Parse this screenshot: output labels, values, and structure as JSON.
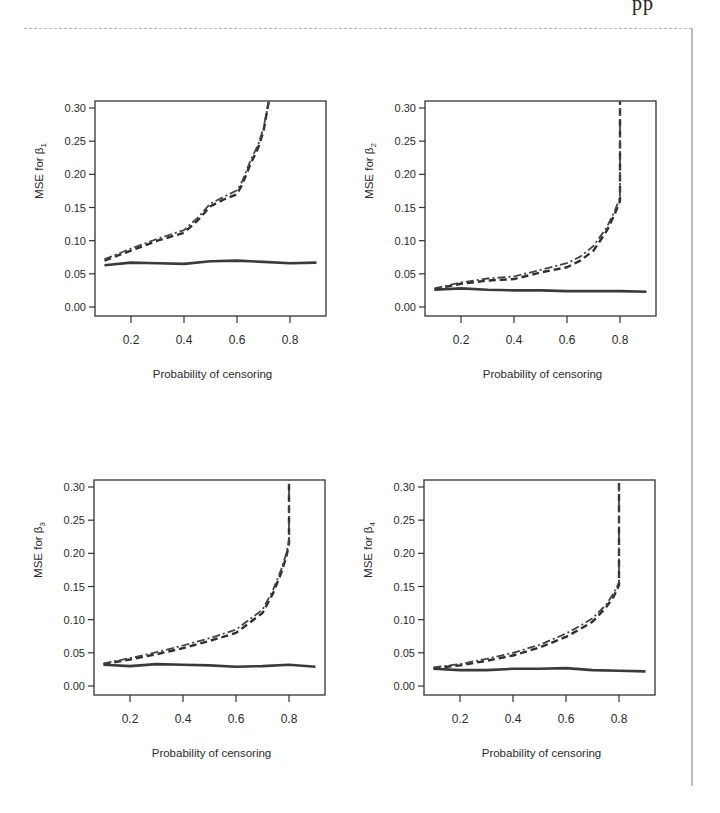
{
  "header": {
    "fragment": "pp"
  },
  "chart_data": [
    {
      "type": "line",
      "title": "",
      "xlabel": "Probability of censoring",
      "ylabel": "MSE for β1",
      "ylabel_main": "MSE for β",
      "ylabel_sub": "1",
      "xlim": [
        0.05,
        0.95
      ],
      "ylim": [
        0.0,
        0.31
      ],
      "xticks": [
        0.2,
        0.4,
        0.6,
        0.8
      ],
      "xtick_labels": [
        "0.2",
        "0.4",
        "0.6",
        "0.8"
      ],
      "yticks": [
        0.0,
        0.05,
        0.1,
        0.15,
        0.2,
        0.25,
        0.3
      ],
      "ytick_labels": [
        "0.00",
        "0.05",
        "0.10",
        "0.15",
        "0.20",
        "0.25",
        "0.30"
      ],
      "grid": false,
      "legend": null,
      "series": [
        {
          "name": "solid",
          "style": "solid",
          "x": [
            0.1,
            0.2,
            0.3,
            0.4,
            0.5,
            0.6,
            0.7,
            0.8,
            0.9
          ],
          "y": [
            0.063,
            0.067,
            0.066,
            0.065,
            0.069,
            0.07,
            0.068,
            0.066,
            0.067
          ]
        },
        {
          "name": "dashed",
          "style": "dashed",
          "x": [
            0.1,
            0.2,
            0.3,
            0.4,
            0.45,
            0.5,
            0.55,
            0.6,
            0.62,
            0.65,
            0.68,
            0.7,
            0.72
          ],
          "y": [
            0.07,
            0.085,
            0.1,
            0.112,
            0.13,
            0.152,
            0.162,
            0.17,
            0.185,
            0.215,
            0.24,
            0.265,
            0.31
          ]
        },
        {
          "name": "dotdash",
          "style": "dotdash",
          "x": [
            0.1,
            0.2,
            0.3,
            0.4,
            0.45,
            0.5,
            0.55,
            0.6,
            0.62,
            0.65,
            0.68,
            0.7,
            0.72
          ],
          "y": [
            0.072,
            0.088,
            0.103,
            0.116,
            0.134,
            0.156,
            0.166,
            0.176,
            0.19,
            0.22,
            0.245,
            0.27,
            0.31
          ]
        }
      ]
    },
    {
      "type": "line",
      "title": "",
      "xlabel": "Probability of censoring",
      "ylabel": "MSE for β2",
      "ylabel_main": "MSE for β",
      "ylabel_sub": "2",
      "xlim": [
        0.05,
        0.95
      ],
      "ylim": [
        0.0,
        0.31
      ],
      "xticks": [
        0.2,
        0.4,
        0.6,
        0.8
      ],
      "xtick_labels": [
        "0.2",
        "0.4",
        "0.6",
        "0.8"
      ],
      "yticks": [
        0.0,
        0.05,
        0.1,
        0.15,
        0.2,
        0.25,
        0.3
      ],
      "ytick_labels": [
        "0.00",
        "0.05",
        "0.10",
        "0.15",
        "0.20",
        "0.25",
        "0.30"
      ],
      "grid": false,
      "legend": null,
      "series": [
        {
          "name": "solid",
          "style": "solid",
          "x": [
            0.1,
            0.2,
            0.3,
            0.4,
            0.5,
            0.6,
            0.7,
            0.8,
            0.9
          ],
          "y": [
            0.026,
            0.028,
            0.026,
            0.025,
            0.025,
            0.024,
            0.024,
            0.024,
            0.023
          ]
        },
        {
          "name": "dashed",
          "style": "dashed",
          "x": [
            0.1,
            0.2,
            0.3,
            0.4,
            0.5,
            0.6,
            0.65,
            0.7,
            0.75,
            0.78,
            0.8,
            0.8
          ],
          "y": [
            0.027,
            0.035,
            0.04,
            0.042,
            0.052,
            0.06,
            0.07,
            0.085,
            0.115,
            0.14,
            0.16,
            0.31
          ]
        },
        {
          "name": "dotdash",
          "style": "dotdash",
          "x": [
            0.1,
            0.2,
            0.3,
            0.4,
            0.5,
            0.6,
            0.65,
            0.7,
            0.75,
            0.78,
            0.8,
            0.8
          ],
          "y": [
            0.028,
            0.037,
            0.043,
            0.046,
            0.056,
            0.066,
            0.076,
            0.092,
            0.12,
            0.145,
            0.165,
            0.31
          ]
        }
      ]
    },
    {
      "type": "line",
      "title": "",
      "xlabel": "Probability of censoring",
      "ylabel": "MSE for β3",
      "ylabel_main": "MSE for β",
      "ylabel_sub": "3",
      "xlim": [
        0.05,
        0.95
      ],
      "ylim": [
        0.0,
        0.31
      ],
      "xticks": [
        0.2,
        0.4,
        0.6,
        0.8
      ],
      "xtick_labels": [
        "0.2",
        "0.4",
        "0.6",
        "0.8"
      ],
      "yticks": [
        0.0,
        0.05,
        0.1,
        0.15,
        0.2,
        0.25,
        0.3
      ],
      "ytick_labels": [
        "0.00",
        "0.05",
        "0.10",
        "0.15",
        "0.20",
        "0.25",
        "0.30"
      ],
      "grid": false,
      "legend": null,
      "series": [
        {
          "name": "solid",
          "style": "solid",
          "x": [
            0.1,
            0.2,
            0.3,
            0.4,
            0.5,
            0.6,
            0.7,
            0.8,
            0.9
          ],
          "y": [
            0.032,
            0.03,
            0.033,
            0.032,
            0.031,
            0.029,
            0.03,
            0.032,
            0.029
          ]
        },
        {
          "name": "dashed",
          "style": "dashed",
          "x": [
            0.1,
            0.2,
            0.3,
            0.4,
            0.5,
            0.6,
            0.65,
            0.7,
            0.74,
            0.77,
            0.79,
            0.8,
            0.8
          ],
          "y": [
            0.033,
            0.04,
            0.048,
            0.057,
            0.068,
            0.08,
            0.095,
            0.11,
            0.14,
            0.17,
            0.195,
            0.215,
            0.31
          ]
        },
        {
          "name": "dotdash",
          "style": "dotdash",
          "x": [
            0.1,
            0.2,
            0.3,
            0.4,
            0.5,
            0.6,
            0.65,
            0.7,
            0.74,
            0.77,
            0.79,
            0.8,
            0.8
          ],
          "y": [
            0.034,
            0.042,
            0.051,
            0.061,
            0.072,
            0.085,
            0.1,
            0.115,
            0.145,
            0.175,
            0.2,
            0.22,
            0.31
          ]
        }
      ]
    },
    {
      "type": "line",
      "title": "",
      "xlabel": "Probability of censoring",
      "ylabel": "MSE for β4",
      "ylabel_main": "MSE for β",
      "ylabel_sub": "4",
      "xlim": [
        0.05,
        0.95
      ],
      "ylim": [
        0.0,
        0.31
      ],
      "xticks": [
        0.2,
        0.4,
        0.6,
        0.8
      ],
      "xtick_labels": [
        "0.2",
        "0.4",
        "0.6",
        "0.8"
      ],
      "yticks": [
        0.0,
        0.05,
        0.1,
        0.15,
        0.2,
        0.25,
        0.3
      ],
      "ytick_labels": [
        "0.00",
        "0.05",
        "0.10",
        "0.15",
        "0.20",
        "0.25",
        "0.30"
      ],
      "grid": false,
      "legend": null,
      "series": [
        {
          "name": "solid",
          "style": "solid",
          "x": [
            0.1,
            0.2,
            0.3,
            0.4,
            0.5,
            0.6,
            0.7,
            0.8,
            0.9
          ],
          "y": [
            0.026,
            0.024,
            0.024,
            0.026,
            0.026,
            0.027,
            0.024,
            0.023,
            0.022
          ]
        },
        {
          "name": "dashed",
          "style": "dashed",
          "x": [
            0.1,
            0.2,
            0.3,
            0.4,
            0.5,
            0.6,
            0.65,
            0.7,
            0.75,
            0.78,
            0.8,
            0.8
          ],
          "y": [
            0.027,
            0.031,
            0.038,
            0.046,
            0.058,
            0.074,
            0.085,
            0.097,
            0.118,
            0.135,
            0.152,
            0.31
          ]
        },
        {
          "name": "dotdash",
          "style": "dotdash",
          "x": [
            0.1,
            0.2,
            0.3,
            0.4,
            0.5,
            0.6,
            0.65,
            0.7,
            0.75,
            0.78,
            0.8,
            0.8
          ],
          "y": [
            0.028,
            0.033,
            0.041,
            0.05,
            0.062,
            0.079,
            0.09,
            0.102,
            0.122,
            0.14,
            0.156,
            0.31
          ]
        }
      ]
    }
  ],
  "panels": [
    {
      "left": 95,
      "top": 101,
      "width": 231,
      "height": 215
    },
    {
      "left": 425,
      "top": 101,
      "width": 231,
      "height": 215
    },
    {
      "left": 94,
      "top": 480,
      "width": 231,
      "height": 215
    },
    {
      "left": 424,
      "top": 480,
      "width": 231,
      "height": 215
    }
  ],
  "colors": {
    "solid": "#3a3a3a",
    "dashed": "#2e2e2e",
    "dotdash": "#444444",
    "axis": "#333333",
    "text": "#2a2a2a"
  }
}
